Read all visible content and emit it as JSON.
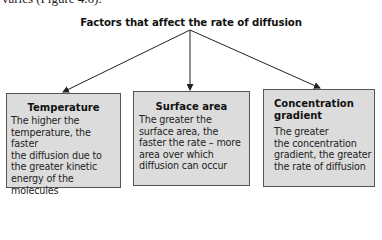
{
  "context_text": "varies (Figure 4.6).",
  "diagram": {
    "title": "Factors that affect the rate of diffusion",
    "boxes": [
      {
        "heading": "Temperature",
        "body": "The higher the temperature, the faster the diffusion due to the greater kinetic energy of the molecules",
        "lines": [
          "The higher the",
          "temperature, the faster",
          "the diffusion due to",
          "the greater kinetic",
          "energy of the molecules"
        ]
      },
      {
        "heading": "Surface area",
        "body": "The greater the surface area, the faster the rate – more area over which diffusion can occur",
        "lines": [
          "The greater the",
          "surface area, the",
          "faster the rate – more",
          "area over which",
          "diffusion can occur"
        ]
      },
      {
        "heading": "Concentration gradient",
        "heading_lines": [
          "Concentration",
          "gradient"
        ],
        "body": "The greater the concentration gradient, the greater the rate of diffusion",
        "lines": [
          "The greater",
          "the concentration",
          "gradient, the greater",
          "the rate of diffusion"
        ]
      }
    ],
    "colors": {
      "box_fill": "#dcdcdc",
      "box_border": "#555555",
      "arrow": "#222222"
    }
  }
}
